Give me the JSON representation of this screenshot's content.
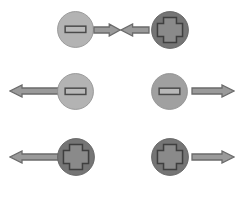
{
  "figure": {
    "background_color": "#ffffff",
    "width": 243,
    "height": 197
  },
  "palette": {
    "disc_light": "#b3b3b3",
    "disc_medium": "#a0a0a0",
    "disc_dark": "#757575",
    "disc_edge": "#8c8c8c",
    "disc_edge_dark": "#5f5f5f",
    "slot_fill": "#b8b8b8",
    "slot_stroke": "#4a4a4a",
    "cross_fill": "#8a8a8a",
    "cross_stroke": "#3f3f3f",
    "arrow_fill": "#9a9a9a",
    "arrow_stroke": "#6b6b6b"
  },
  "rows": [
    {
      "name": "row-attraction",
      "description": "Two discs facing each other with arrows pointing inward",
      "y": 11,
      "items": [
        {
          "name": "disc-slot-light-1",
          "kind": "disc",
          "head_type": "slot",
          "shade": "light",
          "x": 57,
          "y": 11,
          "size": 37
        },
        {
          "name": "arrow-right-short-1",
          "kind": "arrow",
          "direction": "right",
          "x": 93,
          "y": 23,
          "length": 28,
          "thickness": 14
        },
        {
          "name": "arrow-left-short-1",
          "kind": "arrow",
          "direction": "left",
          "x": 120,
          "y": 23,
          "length": 30,
          "thickness": 14
        },
        {
          "name": "disc-cross-dark-1",
          "kind": "disc",
          "head_type": "cross",
          "shade": "dark",
          "x": 151,
          "y": 11,
          "size": 38
        }
      ]
    },
    {
      "name": "row-slot-pair",
      "description": "Two slot-head discs with arrows pointing outward",
      "y": 73,
      "items": [
        {
          "name": "arrow-left-long-1",
          "kind": "arrow",
          "direction": "left",
          "x": 9,
          "y": 84,
          "length": 56,
          "thickness": 14
        },
        {
          "name": "disc-slot-light-2",
          "kind": "disc",
          "head_type": "slot",
          "shade": "light",
          "x": 57,
          "y": 73,
          "size": 37
        },
        {
          "name": "disc-slot-medium-1",
          "kind": "disc",
          "head_type": "slot",
          "shade": "medium",
          "x": 151,
          "y": 73,
          "size": 37
        },
        {
          "name": "arrow-right-long-1",
          "kind": "arrow",
          "direction": "right",
          "x": 191,
          "y": 84,
          "length": 44,
          "thickness": 14
        }
      ]
    },
    {
      "name": "row-cross-pair",
      "description": "Two cross-head discs with arrows pointing outward",
      "y": 138,
      "items": [
        {
          "name": "arrow-left-long-2",
          "kind": "arrow",
          "direction": "left",
          "x": 9,
          "y": 150,
          "length": 56,
          "thickness": 14
        },
        {
          "name": "disc-cross-dark-2",
          "kind": "disc",
          "head_type": "cross",
          "shade": "dark",
          "x": 57,
          "y": 138,
          "size": 38
        },
        {
          "name": "disc-cross-dark-3",
          "kind": "disc",
          "head_type": "cross",
          "shade": "dark",
          "x": 151,
          "y": 138,
          "size": 38
        },
        {
          "name": "arrow-right-long-2",
          "kind": "arrow",
          "direction": "right",
          "x": 191,
          "y": 150,
          "length": 44,
          "thickness": 14
        }
      ]
    }
  ]
}
